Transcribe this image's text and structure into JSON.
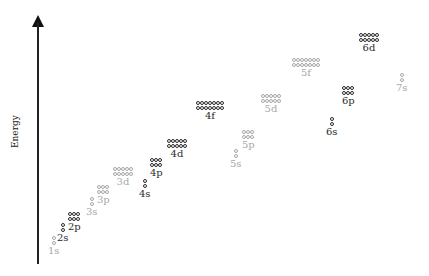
{
  "axis": {
    "label": "Energy"
  },
  "colors": {
    "filled": "#2b2b2b",
    "empty": "#a8a8a8",
    "axis": "#222222"
  },
  "orbitals": [
    {
      "name": "1s",
      "boxes": 1,
      "shade": "light",
      "x": 48,
      "y": 236
    },
    {
      "name": "2s",
      "boxes": 1,
      "shade": "dark",
      "x": 57,
      "y": 223
    },
    {
      "name": "2p",
      "boxes": 3,
      "shade": "dark",
      "x": 68,
      "y": 212
    },
    {
      "name": "3s",
      "boxes": 1,
      "shade": "light",
      "x": 86,
      "y": 197
    },
    {
      "name": "3p",
      "boxes": 3,
      "shade": "light",
      "x": 97,
      "y": 185
    },
    {
      "name": "3d",
      "boxes": 5,
      "shade": "light",
      "x": 113,
      "y": 167
    },
    {
      "name": "4s",
      "boxes": 1,
      "shade": "dark",
      "x": 139,
      "y": 179
    },
    {
      "name": "4p",
      "boxes": 3,
      "shade": "dark",
      "x": 150,
      "y": 158
    },
    {
      "name": "4d",
      "boxes": 5,
      "shade": "dark",
      "x": 167,
      "y": 139
    },
    {
      "name": "4f",
      "boxes": 7,
      "shade": "dark",
      "x": 196,
      "y": 101
    },
    {
      "name": "5s",
      "boxes": 1,
      "shade": "light",
      "x": 230,
      "y": 149
    },
    {
      "name": "5p",
      "boxes": 3,
      "shade": "light",
      "x": 242,
      "y": 130
    },
    {
      "name": "5d",
      "boxes": 5,
      "shade": "light",
      "x": 261,
      "y": 94
    },
    {
      "name": "5f",
      "boxes": 7,
      "shade": "light",
      "x": 292,
      "y": 58
    },
    {
      "name": "6s",
      "boxes": 1,
      "shade": "dark",
      "x": 326,
      "y": 117
    },
    {
      "name": "6p",
      "boxes": 3,
      "shade": "dark",
      "x": 342,
      "y": 86
    },
    {
      "name": "6d",
      "boxes": 5,
      "shade": "dark",
      "x": 359,
      "y": 33
    },
    {
      "name": "7s",
      "boxes": 1,
      "shade": "light",
      "x": 396,
      "y": 73
    }
  ]
}
